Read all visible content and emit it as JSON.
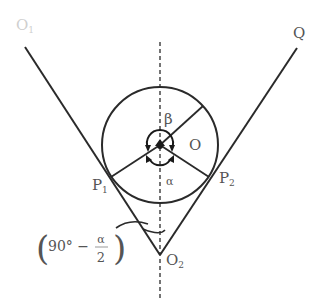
{
  "diagram": {
    "colors": {
      "line": "#2a2a2a",
      "label": "#555555",
      "faint_label": "#cfcfcf",
      "background": "#ffffff"
    },
    "labels": {
      "top_left": "O",
      "top_left_sub": "1",
      "top_right": "Q",
      "beta": "β",
      "center": "O",
      "alpha": "α",
      "p1": "P",
      "p1_sub": "1",
      "p2": "P",
      "p2_sub": "2",
      "vertex": "O",
      "vertex_sub": "2",
      "angle_open": "(",
      "angle_deg": "90° −",
      "angle_num": "α",
      "angle_den": "2",
      "angle_close": ")"
    }
  }
}
